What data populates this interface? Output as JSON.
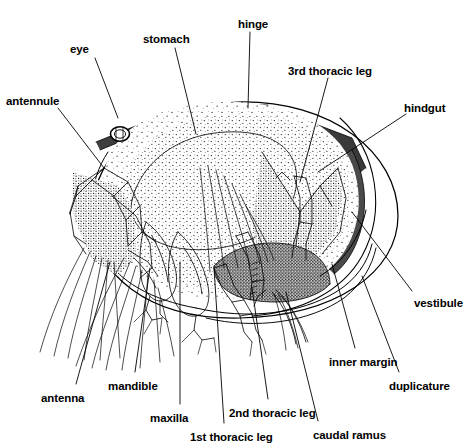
{
  "figure": {
    "domain": "Diagram",
    "width": 472,
    "height": 448,
    "background": "#ffffff",
    "ink_color": "#000000",
    "stipple_color": "#1a1a1a",
    "style": "black and white line drawing with stipple shading"
  },
  "labels": [
    {
      "id": "eye",
      "text": "eye",
      "x": 70,
      "y": 44,
      "anchor": "start",
      "leader": [
        [
          95,
          58
        ],
        [
          118,
          118
        ]
      ]
    },
    {
      "id": "stomach",
      "text": "stomach",
      "x": 143,
      "y": 34,
      "anchor": "start",
      "leader": [
        [
          175,
          48
        ],
        [
          196,
          134
        ]
      ]
    },
    {
      "id": "hinge",
      "text": "hinge",
      "x": 238,
      "y": 19,
      "anchor": "start",
      "leader": [
        [
          250,
          32
        ],
        [
          248,
          108
        ]
      ]
    },
    {
      "id": "3rd-thoracic-leg",
      "text": "3rd thoracic leg",
      "x": 288,
      "y": 66,
      "anchor": "start",
      "leader": [
        [
          328,
          78
        ],
        [
          300,
          182
        ]
      ]
    },
    {
      "id": "antennule",
      "text": "antennule",
      "x": 6,
      "y": 96,
      "anchor": "start",
      "leader": [
        [
          58,
          108
        ],
        [
          104,
          168
        ]
      ]
    },
    {
      "id": "hindgut",
      "text": "hindgut",
      "x": 404,
      "y": 103,
      "anchor": "start",
      "leader": [
        [
          406,
          114
        ],
        [
          318,
          172
        ]
      ]
    },
    {
      "id": "vestibule",
      "text": "vestibule",
      "x": 414,
      "y": 298,
      "anchor": "start",
      "leader": [
        [
          412,
          291
        ],
        [
          352,
          212
        ]
      ]
    },
    {
      "id": "duplicature",
      "text": "duplicature",
      "x": 389,
      "y": 381,
      "anchor": "start",
      "leader": [
        [
          399,
          372
        ],
        [
          362,
          276
        ]
      ]
    },
    {
      "id": "inner-margin",
      "text": "inner margin",
      "x": 329,
      "y": 357,
      "anchor": "start",
      "leader": [
        [
          355,
          348
        ],
        [
          332,
          264
        ]
      ]
    },
    {
      "id": "caudal-ramus",
      "text": "caudal ramus",
      "x": 313,
      "y": 430,
      "anchor": "start",
      "leader": [
        [
          318,
          421
        ],
        [
          286,
          292
        ]
      ]
    },
    {
      "id": "2nd-thoracic-leg",
      "text": "2nd thoracic leg",
      "x": 229,
      "y": 408,
      "anchor": "start",
      "leader": [
        [
          268,
          399
        ],
        [
          252,
          288
        ]
      ]
    },
    {
      "id": "1st-thoracic-leg",
      "text": "1st thoracic leg",
      "x": 190,
      "y": 432,
      "anchor": "start",
      "leader": [
        [
          224,
          423
        ],
        [
          214,
          268
        ]
      ]
    },
    {
      "id": "maxilla",
      "text": "maxilla",
      "x": 150,
      "y": 413,
      "anchor": "start",
      "leader": [
        [
          180,
          404
        ],
        [
          180,
          262
        ]
      ]
    },
    {
      "id": "mandible",
      "text": "mandible",
      "x": 108,
      "y": 381,
      "anchor": "start",
      "leader": [
        [
          135,
          372
        ],
        [
          150,
          268
        ]
      ]
    },
    {
      "id": "antenna",
      "text": "antenna",
      "x": 41,
      "y": 393,
      "anchor": "start",
      "leader": [
        [
          76,
          384
        ],
        [
          110,
          262
        ]
      ]
    }
  ],
  "parts": {
    "carapace": "outer oval valve outline",
    "inner_lamella": "inner margin arc and duplicature arc",
    "hinge_band": "dark dorsal hinge band",
    "stipple_regions": [
      "body mass",
      "hindgut",
      "thoracic muscle block"
    ],
    "appendages": [
      "antennule",
      "antenna",
      "mandible",
      "maxilla",
      "1st thoracic leg",
      "2nd thoracic leg",
      "3rd thoracic leg",
      "caudal ramus"
    ]
  }
}
